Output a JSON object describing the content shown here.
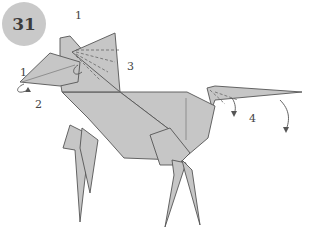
{
  "step": {
    "number": "31",
    "badge_color": "#c9c9c9"
  },
  "figure": {
    "paper_color": "#c6c6c6",
    "line_color": "#555555",
    "labels": [
      {
        "id": "1",
        "text": "1",
        "x": 75,
        "y": 19
      },
      {
        "id": "1b",
        "text": "1",
        "x": 22,
        "y": 75
      },
      {
        "id": "2",
        "text": "2",
        "x": 37,
        "y": 108
      },
      {
        "id": "3",
        "text": "3",
        "x": 127,
        "y": 70
      },
      {
        "id": "4",
        "text": "4",
        "x": 249,
        "y": 121
      }
    ]
  }
}
